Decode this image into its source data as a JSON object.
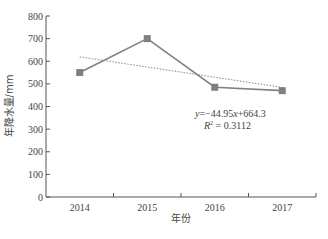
{
  "chart_data": {
    "type": "line",
    "title": "",
    "xlabel": "年份",
    "ylabel": "年降水量/mm",
    "categories": [
      "2014",
      "2015",
      "2016",
      "2017"
    ],
    "series": [
      {
        "name": "年降水量",
        "values": [
          550,
          700,
          485,
          470
        ],
        "color": "#808080",
        "marker": "square"
      }
    ],
    "trendline": {
      "type": "linear",
      "equation": "y=−44.95x+664.3",
      "r_squared": "R² = 0.3112",
      "slope": -44.95,
      "intercept": 664.3,
      "style": "dotted",
      "color": "#808080"
    },
    "yticks": [
      "0",
      "100",
      "200",
      "300",
      "400",
      "500",
      "600",
      "700",
      "800"
    ],
    "ylim": [
      0,
      800
    ],
    "grid": false,
    "legend": "none"
  },
  "labels": {
    "xlabel": "年份",
    "ylabel": "年降水量/mm",
    "eq_y": "y",
    "eq_rest": "=−44.95",
    "eq_x": "x",
    "eq_tail": "+664.3",
    "r2_r": "R",
    "r2_sup": "2",
    "r2_rest": " = 0.3112"
  }
}
